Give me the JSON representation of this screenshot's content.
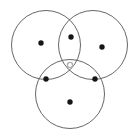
{
  "figure": {
    "width": 139,
    "height": 140,
    "background_color": "#ffffff"
  },
  "chart_data": {
    "type": "scatter",
    "title": "",
    "subtitle": "",
    "xlabel": "",
    "ylabel": "",
    "xlim": [
      0,
      139
    ],
    "ylim": [
      0,
      140
    ],
    "grid": false,
    "legend": "none",
    "annotations": [],
    "shapes": {
      "kind": "circle-outline",
      "stroke_color": "#555555",
      "stroke_width": 0.9,
      "fill": "none",
      "radius": 34.5,
      "items": [
        {
          "name": "circle-top-left",
          "cx": 46,
          "cy": 45,
          "r": 34.5
        },
        {
          "name": "circle-top-right",
          "cx": 93,
          "cy": 45,
          "r": 34.5
        },
        {
          "name": "circle-bottom-center",
          "cx": 70,
          "cy": 94,
          "r": 34.5
        }
      ]
    },
    "series": [
      {
        "name": "filled-points",
        "marker": "filled-dot",
        "color": "#161616",
        "size": 5.4,
        "points": [
          {
            "name": "point-top-center",
            "x": 71,
            "y": 37
          },
          {
            "name": "point-left",
            "x": 41,
            "y": 43
          },
          {
            "name": "point-right",
            "x": 102,
            "y": 47
          },
          {
            "name": "point-lower-left",
            "x": 46,
            "y": 79
          },
          {
            "name": "point-lower-right",
            "x": 95,
            "y": 79
          },
          {
            "name": "point-bottom-center",
            "x": 70,
            "y": 102
          }
        ]
      },
      {
        "name": "hollow-points",
        "marker": "open-dot",
        "color": "#b0b0b0",
        "size": 6.0,
        "points": [
          {
            "name": "point-center-open",
            "x": 70,
            "y": 65
          }
        ]
      }
    ],
    "counts": {
      "circles": 3,
      "filled_points": 6,
      "hollow_points": 1,
      "total_points": 7
    }
  }
}
